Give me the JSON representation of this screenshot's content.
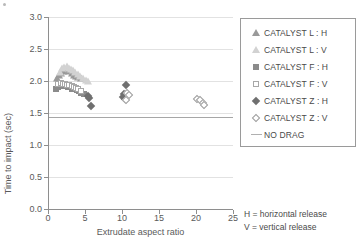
{
  "chart_data": {
    "type": "scatter",
    "title": "",
    "xlabel": "Extrudate aspect ratio",
    "ylabel": "Time to impact (sec)",
    "xlim": [
      0,
      25
    ],
    "ylim": [
      0.0,
      3.0
    ],
    "xticks": [
      0,
      5,
      10,
      15,
      20,
      25
    ],
    "yticks": [
      0.0,
      0.5,
      1.0,
      1.5,
      2.0,
      2.5,
      3.0
    ],
    "xtick_labels": [
      "0",
      "5",
      "10",
      "15",
      "20",
      "25"
    ],
    "ytick_labels": [
      "0.0",
      "0.5",
      "1.0",
      "1.5",
      "2.0",
      "2.5",
      "3.0"
    ],
    "grid": "horizontal",
    "legend_position": "right-outside",
    "reference_lines": [
      {
        "name": "NO DRAG",
        "orientation": "horizontal",
        "y": 1.44,
        "color": "#a6a6a6"
      }
    ],
    "series": [
      {
        "name": "CATALYST L : H",
        "marker": "triangle-filled",
        "color": "#9a9a9a",
        "points": [
          [
            1.2,
            2.05
          ],
          [
            1.5,
            2.1
          ],
          [
            1.8,
            2.13
          ],
          [
            2.0,
            2.16
          ],
          [
            2.3,
            2.18
          ],
          [
            2.6,
            2.2
          ],
          [
            2.9,
            2.15
          ],
          [
            3.2,
            2.12
          ],
          [
            3.5,
            2.1
          ],
          [
            3.8,
            2.08
          ],
          [
            4.1,
            2.06
          ],
          [
            4.4,
            2.04
          ]
        ]
      },
      {
        "name": "CATALYST L : V",
        "marker": "triangle-open",
        "color": "#d2d2d2",
        "points": [
          [
            1.6,
            2.14
          ],
          [
            1.9,
            2.2
          ],
          [
            2.2,
            2.22
          ],
          [
            2.5,
            2.23
          ],
          [
            2.8,
            2.21
          ],
          [
            3.1,
            2.19
          ],
          [
            3.4,
            2.17
          ],
          [
            3.7,
            2.14
          ],
          [
            4.0,
            2.11
          ],
          [
            4.3,
            2.08
          ],
          [
            4.7,
            2.05
          ],
          [
            5.1,
            2.02
          ],
          [
            5.4,
            2.0
          ]
        ]
      },
      {
        "name": "CATALYST F : H",
        "marker": "square-filled",
        "color": "#8b8b8b",
        "points": [
          [
            1.1,
            1.88
          ],
          [
            1.3,
            1.9
          ],
          [
            1.6,
            1.92
          ],
          [
            1.9,
            1.93
          ],
          [
            2.1,
            1.94
          ],
          [
            2.4,
            1.92
          ],
          [
            2.7,
            1.91
          ],
          [
            3.0,
            1.9
          ],
          [
            3.3,
            1.88
          ],
          [
            3.6,
            1.87
          ],
          [
            3.9,
            1.86
          ],
          [
            4.2,
            1.84
          ],
          [
            4.5,
            1.82
          ],
          [
            4.8,
            1.8
          ]
        ]
      },
      {
        "name": "CATALYST F : V",
        "marker": "square-open",
        "color": "#a8a8a8",
        "points": [
          [
            1.4,
            1.95
          ],
          [
            1.7,
            1.97
          ],
          [
            2.0,
            1.96
          ],
          [
            2.3,
            1.95
          ],
          [
            2.6,
            1.94
          ],
          [
            2.9,
            1.93
          ],
          [
            3.2,
            1.92
          ],
          [
            3.5,
            1.9
          ],
          [
            3.8,
            1.89
          ],
          [
            4.1,
            1.87
          ],
          [
            4.4,
            1.85
          ]
        ]
      },
      {
        "name": "CATALYST Z : H",
        "marker": "diamond-filled",
        "color": "#6f6f6f",
        "points": [
          [
            5.4,
            1.77
          ],
          [
            5.6,
            1.74
          ],
          [
            5.8,
            1.61
          ],
          [
            10.5,
            1.93
          ],
          [
            10.3,
            1.79
          ],
          [
            10.2,
            1.75
          ],
          [
            10.4,
            1.72
          ]
        ]
      },
      {
        "name": "CATALYST Z : V",
        "marker": "diamond-open",
        "color": "#9c9c9c",
        "points": [
          [
            10.7,
            1.81
          ],
          [
            10.9,
            1.78
          ],
          [
            10.6,
            1.71
          ],
          [
            20.2,
            1.72
          ],
          [
            20.6,
            1.7
          ],
          [
            20.9,
            1.66
          ],
          [
            21.1,
            1.62
          ]
        ]
      }
    ]
  },
  "legend": {
    "entries": [
      {
        "label": "CATALYST L : H",
        "marker": "triangle-filled"
      },
      {
        "label": "CATALYST L : V",
        "marker": "triangle-open"
      },
      {
        "label": "CATALYST F : H",
        "marker": "square-filled"
      },
      {
        "label": "CATALYST F : V",
        "marker": "square-open"
      },
      {
        "label": "CATALYST Z : H",
        "marker": "diamond-filled"
      },
      {
        "label": "CATALYST Z : V",
        "marker": "diamond-open"
      },
      {
        "label": "NO DRAG",
        "marker": "line"
      }
    ]
  },
  "notes": [
    "H = horizontal release",
    "V = vertical release"
  ]
}
